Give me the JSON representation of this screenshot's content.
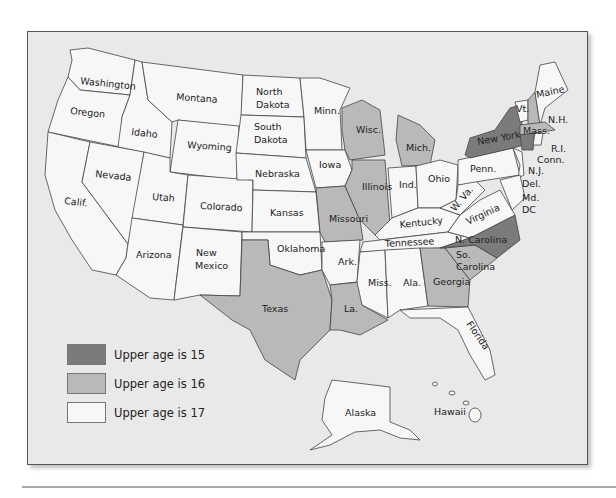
{
  "colors": {
    "age15": "#7b7b7b",
    "age16": "#b9b9b9",
    "age17": "#f7f7f7",
    "water": "#e9e9e9",
    "border": "#444444"
  },
  "legend": [
    {
      "key": "age15",
      "label": "Upper age is 15"
    },
    {
      "key": "age16",
      "label": "Upper age is 16"
    },
    {
      "key": "age17",
      "label": "Upper age is 17"
    }
  ],
  "states": {
    "washington": {
      "label": "Washington",
      "age": 17
    },
    "oregon": {
      "label": "Oregon",
      "age": 17
    },
    "calif": {
      "label": "Calif.",
      "age": 17
    },
    "idaho": {
      "label": "Idaho",
      "age": 17
    },
    "nevada": {
      "label": "Nevada",
      "age": 17
    },
    "montana": {
      "label": "Montana",
      "age": 17
    },
    "wyoming": {
      "label": "Wyoming",
      "age": 17
    },
    "utah": {
      "label": "Utah",
      "age": 17
    },
    "arizona": {
      "label": "Arizona",
      "age": 17
    },
    "colorado": {
      "label": "Colorado",
      "age": 17
    },
    "new_mexico_1": {
      "label": "New",
      "age": 17
    },
    "new_mexico_2": {
      "label": "Mexico",
      "age": 17
    },
    "north_dakota_1": {
      "label": "North",
      "age": 17
    },
    "north_dakota_2": {
      "label": "Dakota",
      "age": 17
    },
    "south_dakota_1": {
      "label": "South",
      "age": 17
    },
    "south_dakota_2": {
      "label": "Dakota",
      "age": 17
    },
    "nebraska": {
      "label": "Nebraska",
      "age": 17
    },
    "kansas": {
      "label": "Kansas",
      "age": 17
    },
    "oklahoma": {
      "label": "Oklahoma",
      "age": 17
    },
    "texas": {
      "label": "Texas",
      "age": 16
    },
    "minn": {
      "label": "Minn.",
      "age": 17
    },
    "iowa": {
      "label": "Iowa",
      "age": 17
    },
    "missouri": {
      "label": "Missouri",
      "age": 16
    },
    "ark": {
      "label": "Ark.",
      "age": 17
    },
    "la": {
      "label": "La.",
      "age": 16
    },
    "wisc": {
      "label": "Wisc.",
      "age": 16
    },
    "illinois": {
      "label": "Illinois",
      "age": 16
    },
    "mich": {
      "label": "Mich.",
      "age": 16
    },
    "ind": {
      "label": "Ind.",
      "age": 17
    },
    "ohio": {
      "label": "Ohio",
      "age": 17
    },
    "kentucky": {
      "label": "Kentucky",
      "age": 17
    },
    "tennessee": {
      "label": "Tennessee",
      "age": 17
    },
    "miss": {
      "label": "Miss.",
      "age": 17
    },
    "ala": {
      "label": "Ala.",
      "age": 17
    },
    "georgia": {
      "label": "Georgia",
      "age": 16
    },
    "florida": {
      "label": "Florida",
      "age": 17
    },
    "so_carolina_1": {
      "label": "So.",
      "age": 16
    },
    "so_carolina_2": {
      "label": "Carolina",
      "age": 16
    },
    "n_carolina": {
      "label": "N. Carolina",
      "age": 15
    },
    "virginia": {
      "label": "Virginia",
      "age": 17
    },
    "w_va": {
      "label": "W. Va.",
      "age": 17
    },
    "penn": {
      "label": "Penn.",
      "age": 17
    },
    "new_york": {
      "label": "New York",
      "age": 15
    },
    "vt": {
      "label": "Vt.",
      "age": 17
    },
    "nh": {
      "label": "N.H.",
      "age": 16
    },
    "maine": {
      "label": "Maine",
      "age": 17
    },
    "mass": {
      "label": "Mass.",
      "age": 16
    },
    "ri": {
      "label": "R.I.",
      "age": 17
    },
    "conn": {
      "label": "Conn.",
      "age": 15
    },
    "nj": {
      "label": "N.J.",
      "age": 17
    },
    "del": {
      "label": "Del.",
      "age": 17
    },
    "md": {
      "label": "Md.",
      "age": 17
    },
    "dc": {
      "label": "DC",
      "age": 17
    },
    "alaska": {
      "label": "Alaska",
      "age": 17
    },
    "hawaii": {
      "label": "Hawaii",
      "age": 17
    }
  }
}
